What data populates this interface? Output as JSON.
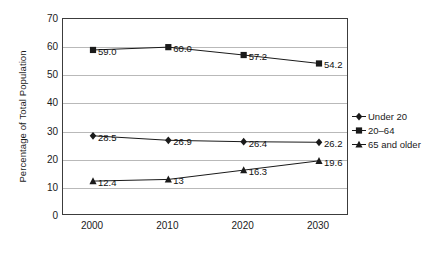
{
  "chart_data": {
    "type": "line",
    "title": "",
    "xlabel": "",
    "ylabel": "Percentage of Total Population",
    "categories": [
      "2000",
      "2010",
      "2020",
      "2030"
    ],
    "x": [
      2000,
      2010,
      2020,
      2030
    ],
    "xlim": [
      1995,
      2035
    ],
    "ylim": [
      0,
      70
    ],
    "yticks": [
      "70",
      "60",
      "50",
      "40",
      "30",
      "20",
      "10",
      "0"
    ],
    "ytick_values": [
      70,
      60,
      50,
      40,
      30,
      20,
      10,
      0
    ],
    "grid": "horizontal",
    "legend_position": "right",
    "series": [
      {
        "name": "Under 20",
        "marker": "diamond",
        "color": "#1a1a1a",
        "values": [
          28.5,
          26.9,
          26.4,
          26.2
        ],
        "labels": [
          "28.5",
          "26.9",
          "26.4",
          "26.2"
        ]
      },
      {
        "name": "20–64",
        "marker": "square",
        "color": "#1a1a1a",
        "values": [
          59.0,
          60.0,
          57.2,
          54.2
        ],
        "labels": [
          "59.0",
          "60.0",
          "57.2",
          "54.2"
        ]
      },
      {
        "name": "65 and older",
        "marker": "triangle",
        "color": "#1a1a1a",
        "values": [
          12.4,
          13.0,
          16.3,
          19.6
        ],
        "labels": [
          "12.4",
          "13",
          "16.3",
          "19.6"
        ]
      }
    ]
  },
  "legend": {
    "items": [
      {
        "label": "Under 20",
        "marker": "diamond"
      },
      {
        "label": "20–64",
        "marker": "square"
      },
      {
        "label": "65 and older",
        "marker": "triangle"
      }
    ]
  },
  "colors": {
    "line": "#1a1a1a",
    "grid": "#b9b9b9",
    "frame": "#3c3c3c",
    "text": "#1a1a1a",
    "background": "#ffffff"
  }
}
